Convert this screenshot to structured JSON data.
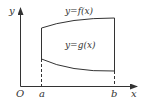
{
  "diagram": {
    "type": "area-between-curves",
    "axes": {
      "x_label": "x",
      "y_label": "y",
      "origin_label": "O"
    },
    "points": {
      "a_label": "a",
      "b_label": "b"
    },
    "curves": {
      "upper_label": "y=f(x)",
      "lower_label": "y=g(x)"
    },
    "colors": {
      "line": "#333333",
      "background": "#ffffff"
    }
  }
}
